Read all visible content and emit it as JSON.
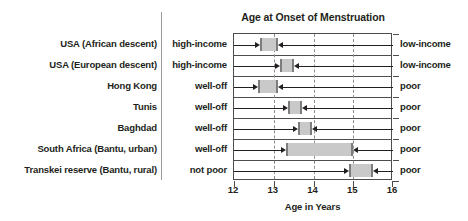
{
  "chart_data": {
    "type": "bar",
    "orientation": "horizontal",
    "title": "Age at Onset of Menstruation",
    "xlabel": "Age in Years",
    "ylabel": "",
    "xlim": [
      12,
      16
    ],
    "xticks": [
      "12",
      "13",
      "14",
      "15",
      "16"
    ],
    "gridlines_at": [
      13,
      14,
      15
    ],
    "grid": true,
    "legend": "none",
    "bar_color": "#c9c9c9",
    "bar_edge_color": "#7d7d7d",
    "axis_color": "#4d4d4d",
    "categories": [
      "USA (African descent)",
      "USA (European descent)",
      "Hong Kong",
      "Tunis",
      "Baghdad",
      "South Africa (Bantu, urban)",
      "Transkei reserve (Bantu, rural)"
    ],
    "left_class_labels": [
      "high-income",
      "high-income",
      "well-off",
      "well-off",
      "well-off",
      "well-off",
      "not poor"
    ],
    "right_class_labels": [
      "low-income",
      "low-income",
      "poor",
      "poor",
      "poor",
      "poor",
      "poor"
    ],
    "ranges": [
      {
        "category": "USA (African descent)",
        "start": 12.65,
        "end": 13.1
      },
      {
        "category": "USA (European descent)",
        "start": 13.15,
        "end": 13.5
      },
      {
        "category": "Hong Kong",
        "start": 12.6,
        "end": 13.1
      },
      {
        "category": "Tunis",
        "start": 13.35,
        "end": 13.7
      },
      {
        "category": "Baghdad",
        "start": 13.6,
        "end": 13.95
      },
      {
        "category": "South Africa (Bantu, urban)",
        "start": 13.3,
        "end": 15.0
      },
      {
        "category": "Transkei reserve (Bantu, rural)",
        "start": 14.9,
        "end": 15.5
      }
    ]
  }
}
